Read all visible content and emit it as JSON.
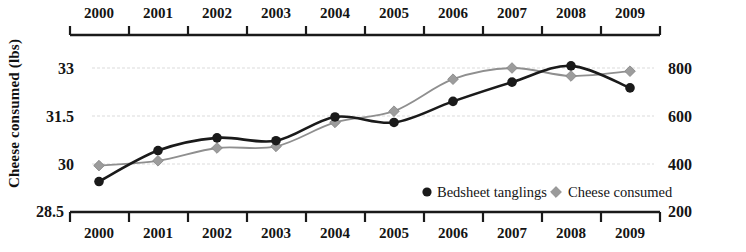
{
  "chart_data": {
    "type": "line",
    "title": "",
    "subtitle": "",
    "categories": [
      "2000",
      "2001",
      "2002",
      "2003",
      "2004",
      "2005",
      "2006",
      "2007",
      "2008",
      "2009"
    ],
    "x": [
      2000,
      2001,
      2002,
      2003,
      2004,
      2005,
      2006,
      2007,
      2008,
      2009
    ],
    "series": [
      {
        "name": "Bedsheet tanglings",
        "axis": "right",
        "marker": "circle",
        "color": "#1a1a1a",
        "values": [
          327,
          456,
          509,
          497,
          596,
          573,
          661,
          741,
          809,
          717
        ]
      },
      {
        "name": "Cheese consumed",
        "axis": "left",
        "marker": "diamond",
        "color": "#8f8f8f",
        "values": [
          29.95,
          30.1,
          30.5,
          30.55,
          31.3,
          31.65,
          32.65,
          33.0,
          32.75,
          32.9
        ]
      }
    ],
    "left_axis": {
      "label": "Cheese consumed (lbs)",
      "ticks": [
        "33",
        "31.5",
        "30",
        "28.5"
      ],
      "tick_values": [
        33,
        31.5,
        30,
        28.5
      ],
      "ylim": [
        28.5,
        33.5
      ]
    },
    "right_axis": {
      "label": "Deaths by bedsheet tanglings",
      "ticks": [
        "800",
        "600",
        "400",
        "200"
      ],
      "tick_values": [
        800,
        600,
        400,
        200
      ],
      "ylim": [
        200,
        866.7
      ]
    },
    "x_axis_top": {
      "ticks": [
        "2000",
        "2001",
        "2002",
        "2003",
        "2004",
        "2005",
        "2006",
        "2007",
        "2008",
        "2009"
      ]
    },
    "x_axis_bottom": {
      "ticks": [
        "2000",
        "2001",
        "2002",
        "2003",
        "2004",
        "2005",
        "2006",
        "2007",
        "2008",
        "2009"
      ]
    },
    "grid": true,
    "gridlines_at": [
      33,
      31.5,
      30
    ],
    "legend": {
      "position": "inside-bottom-right",
      "entries": [
        {
          "label": "Bedsheet tanglings",
          "marker": "circle",
          "color": "#1a1a1a"
        },
        {
          "label": "Cheese consumed",
          "marker": "diamond",
          "color": "#8f8f8f"
        }
      ]
    },
    "colors": {
      "bedsheet": "#1a1a1a",
      "cheese": "#8f8f8f",
      "axis": "#1a1a1a",
      "grid": "#d8d8d8",
      "background": "#ffffff"
    }
  }
}
